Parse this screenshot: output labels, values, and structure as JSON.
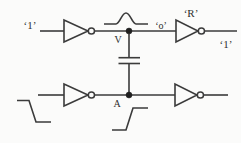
{
  "figure": {
    "type": "circuit-diagram",
    "labels": {
      "top_input": "‘1’",
      "victim_node": "V",
      "receiver_input": "‘o’",
      "receiver_name": "‘R’",
      "top_output": "‘1’",
      "bottom_node": "A"
    },
    "icons": {
      "gates": "inverter-gate",
      "gate_count": 4,
      "coupling": "capacitor-icon",
      "top_waveform": "glitch-pulse-icon",
      "bottom_left_waveform": "falling-edge-icon",
      "bottom_right_waveform": "rising-edge-icon",
      "junctions": "junction-dot"
    },
    "colors": {
      "line": "#3b3b3b",
      "text": "#2e2e2e",
      "background": "#fbfbfa"
    }
  }
}
